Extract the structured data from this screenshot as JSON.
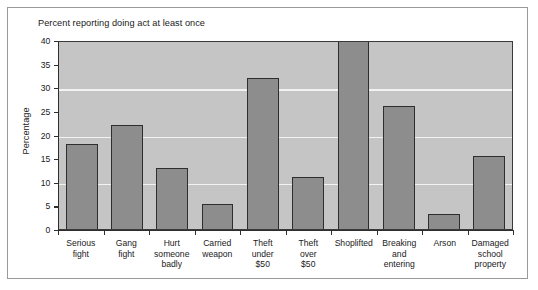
{
  "chart_data": {
    "type": "bar",
    "title": "Percent reporting doing act at least once",
    "xlabel": "",
    "ylabel": "Percentage",
    "ylim": [
      0,
      40
    ],
    "ytick_labels": [
      "0",
      "5",
      "10",
      "15",
      "20",
      "25",
      "30",
      "35",
      "40"
    ],
    "yticks": [
      0,
      5,
      10,
      15,
      20,
      25,
      30,
      35,
      40
    ],
    "gridlines": [
      10,
      20,
      30
    ],
    "grid": true,
    "legend": null,
    "categories": [
      "Serious fight",
      "Gang fight",
      "Hurt someone badly",
      "Carried weapon",
      "Theft under $50",
      "Theft over $50",
      "Shoplifted",
      "Breaking and entering",
      "Arson",
      "Damaged school property"
    ],
    "category_lines": [
      [
        "Serious",
        "fight"
      ],
      [
        "Gang",
        "fight"
      ],
      [
        "Hurt",
        "someone",
        "badly"
      ],
      [
        "Carried",
        "weapon"
      ],
      [
        "Theft",
        "under",
        "$50"
      ],
      [
        "Theft",
        "over",
        "$50"
      ],
      [
        "Shoplifted"
      ],
      [
        "Breaking",
        "and",
        "entering"
      ],
      [
        "Arson"
      ],
      [
        "Damaged",
        "school",
        "property"
      ]
    ],
    "values": [
      18,
      22,
      13,
      5.2,
      32,
      11,
      40,
      26,
      3.2,
      15.5
    ],
    "bar_color": "#8d8d8d",
    "bar_edge_color": "#2e2e2e",
    "plot_background": "#c5c5c5",
    "gridline_color": "#f2f2f2",
    "axis_color": "#2e2e2e"
  }
}
